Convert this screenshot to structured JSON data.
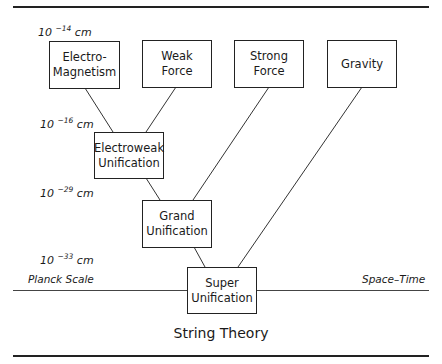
{
  "scales": [
    {
      "base": "10",
      "exp": "−14",
      "unit": "cm"
    },
    {
      "base": "10",
      "exp": "−16",
      "unit": "cm"
    },
    {
      "base": "10",
      "exp": "−29",
      "unit": "cm"
    },
    {
      "base": "10",
      "exp": "−33",
      "unit": "cm"
    }
  ],
  "forces": [
    {
      "line1": "Electro-",
      "line2": "Magnetism"
    },
    {
      "line1": "Weak",
      "line2": "Force"
    },
    {
      "line1": "Strong",
      "line2": "Force"
    },
    {
      "line1": "Gravity",
      "line2": ""
    }
  ],
  "unifications": {
    "electroweak": {
      "line1": "Electroweak",
      "line2": "Unification"
    },
    "grand": {
      "line1": "Grand",
      "line2": "Unification"
    },
    "super": {
      "line1": "Super",
      "line2": "Unification"
    }
  },
  "baseline": {
    "left_label": "Planck Scale",
    "right_label": "Space–Time"
  },
  "title": "String Theory"
}
